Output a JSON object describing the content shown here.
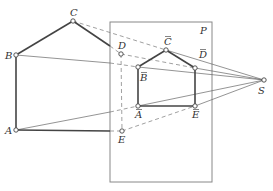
{
  "diagram": {
    "plane_label": "P",
    "center_label": "S",
    "original_points": {
      "A": {
        "label": "A",
        "x": 16,
        "y": 130
      },
      "B": {
        "label": "B",
        "x": 16,
        "y": 55
      },
      "C": {
        "label": "C",
        "x": 73,
        "y": 21
      },
      "D": {
        "label": "D",
        "x": 121,
        "y": 54
      },
      "E": {
        "label": "E",
        "x": 122,
        "y": 131
      }
    },
    "projected_points": {
      "A": {
        "label": "A",
        "x": 138,
        "y": 106
      },
      "B": {
        "label": "B",
        "x": 138,
        "y": 67
      },
      "C": {
        "label": "C",
        "x": 166,
        "y": 50
      },
      "D": {
        "label": "D",
        "x": 195,
        "y": 68
      },
      "E": {
        "label": "E",
        "x": 195,
        "y": 106
      }
    },
    "center": {
      "label": "S",
      "x": 264,
      "y": 80
    },
    "plane_rect": {
      "x": 110,
      "y": 22,
      "w": 102,
      "h": 160
    }
  }
}
